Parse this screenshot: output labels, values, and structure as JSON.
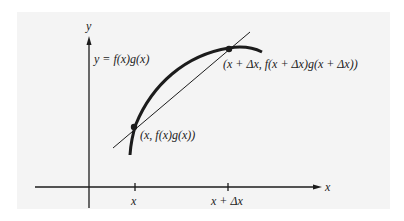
{
  "figure": {
    "panel_color": "#f4f4f4",
    "ink_color": "#1c1c1c",
    "axes": {
      "x_label": "x",
      "y_label": "y"
    },
    "curve_label": "y = f(x)g(x)",
    "points": [
      {
        "name": "P",
        "label": "(x, f(x)g(x))"
      },
      {
        "name": "Q",
        "label": "(x + Δx, f(x + Δx)g(x + Δx))"
      }
    ],
    "ticks": [
      {
        "label": "x"
      },
      {
        "label": "x + Δx"
      }
    ],
    "secant_line": "line through (x, f(x)g(x)) and (x + Δx, f(x + Δx)g(x + Δx))"
  }
}
